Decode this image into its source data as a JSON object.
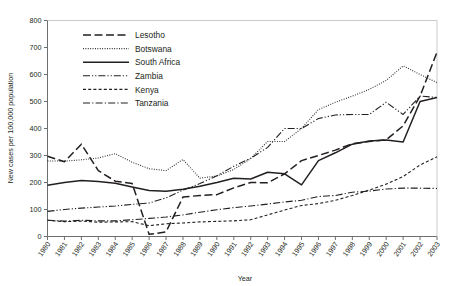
{
  "chart_data": {
    "type": "line",
    "title": "",
    "xlabel": "Year",
    "ylabel": "New cases per 100,000 population",
    "xlim": [
      1980,
      2003
    ],
    "ylim": [
      0,
      800
    ],
    "ytick_step": 100,
    "yticks": [
      0,
      100,
      200,
      300,
      400,
      500,
      600,
      700,
      800
    ],
    "grid": false,
    "legend_position": "top-left",
    "categories": [
      1980,
      1981,
      1982,
      1983,
      1984,
      1985,
      1986,
      1987,
      1988,
      1989,
      1990,
      1991,
      1992,
      1993,
      1994,
      1995,
      1996,
      1997,
      1998,
      1999,
      2000,
      2001,
      2002,
      2003
    ],
    "xtick_labels": [
      "1980",
      "1981",
      "1982",
      "1983",
      "1984",
      "1985",
      "1986",
      "1987",
      "1988",
      "1989",
      "1990",
      "1991",
      "1992",
      "1993",
      "1994",
      "1995",
      "1996",
      "1997",
      "1998",
      "1999",
      "2000",
      "2001",
      "2002",
      "2003"
    ],
    "series": [
      {
        "name": "Lesotho",
        "style": "long-dash",
        "values": [
          297,
          277,
          342,
          244,
          205,
          196,
          8,
          17,
          146,
          152,
          155,
          180,
          200,
          199,
          232,
          281,
          300,
          320,
          344,
          352,
          358,
          410,
          520,
          683
        ]
      },
      {
        "name": "Botswana",
        "style": "dotted",
        "values": [
          280,
          279,
          284,
          291,
          307,
          275,
          251,
          244,
          285,
          216,
          224,
          248,
          289,
          352,
          352,
          400,
          470,
          497,
          520,
          545,
          578,
          632,
          600,
          570
        ]
      },
      {
        "name": "South Africa",
        "style": "solid",
        "values": [
          190,
          200,
          207,
          204,
          197,
          183,
          170,
          168,
          175,
          186,
          200,
          216,
          213,
          238,
          232,
          191,
          281,
          310,
          342,
          354,
          357,
          350,
          500,
          515
        ]
      },
      {
        "name": "Zambia",
        "style": "dash-dot-dot",
        "values": [
          93,
          100,
          105,
          109,
          113,
          119,
          124,
          143,
          172,
          196,
          225,
          260,
          290,
          330,
          400,
          400,
          437,
          450,
          452,
          452,
          497,
          452,
          520,
          515
        ]
      },
      {
        "name": "Kenya",
        "style": "short-dash",
        "values": [
          60,
          55,
          57,
          53,
          54,
          55,
          40,
          47,
          50,
          54,
          56,
          58,
          62,
          80,
          98,
          115,
          122,
          134,
          152,
          172,
          194,
          222,
          265,
          295
        ]
      },
      {
        "name": "Tanzania",
        "style": "dash-dot",
        "values": [
          60,
          57,
          60,
          58,
          58,
          62,
          67,
          72,
          80,
          90,
          99,
          107,
          113,
          120,
          128,
          134,
          148,
          152,
          164,
          168,
          176,
          179,
          179,
          178
        ]
      }
    ]
  },
  "legend": {
    "items": [
      {
        "label": "Lesotho"
      },
      {
        "label": "Botswana"
      },
      {
        "label": "South Africa"
      },
      {
        "label": "Zambia"
      },
      {
        "label": "Kenya"
      },
      {
        "label": "Tanzania"
      }
    ]
  },
  "colors": {
    "ink": "#231f20",
    "axis": "#6d6e70",
    "background": "#ffffff"
  }
}
